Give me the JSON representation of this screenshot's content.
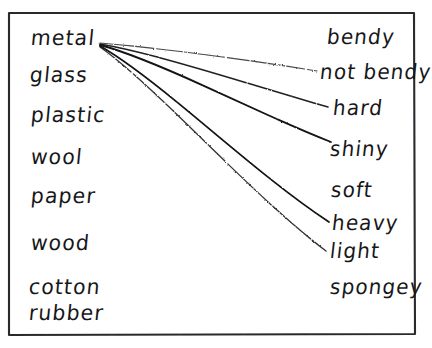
{
  "worksheet": {
    "title": "Materials and Properties Matching",
    "style": {
      "ink_color": "#17171a",
      "paper_color": "#ffffff",
      "border_color": "#2b2b2e"
    },
    "border": {
      "x": 8,
      "y": 12,
      "width": 407,
      "height": 323
    },
    "columns": {
      "left": {
        "name": "materials",
        "items": [
          {
            "id": "metal",
            "label": "metal",
            "x": 30,
            "y": 28
          },
          {
            "id": "glass",
            "label": "glass",
            "x": 29,
            "y": 65
          },
          {
            "id": "plastic",
            "label": "plastic",
            "x": 30,
            "y": 105
          },
          {
            "id": "wool",
            "label": "wool",
            "x": 30,
            "y": 147
          },
          {
            "id": "paper",
            "label": "paper",
            "x": 30,
            "y": 186
          },
          {
            "id": "wood",
            "label": "wood",
            "x": 30,
            "y": 233
          },
          {
            "id": "cotton",
            "label": "cotton",
            "x": 28,
            "y": 277
          },
          {
            "id": "rubber",
            "label": "rubber",
            "x": 28,
            "y": 303
          }
        ]
      },
      "right": {
        "name": "properties",
        "items": [
          {
            "id": "bendy",
            "label": "bendy",
            "x": 326,
            "y": 27
          },
          {
            "id": "not-bendy",
            "label": "not bendy",
            "x": 319,
            "y": 62
          },
          {
            "id": "hard",
            "label": "hard",
            "x": 332,
            "y": 98
          },
          {
            "id": "shiny",
            "label": "shiny",
            "x": 329,
            "y": 139
          },
          {
            "id": "soft",
            "label": "soft",
            "x": 330,
            "y": 180
          },
          {
            "id": "heavy",
            "label": "heavy",
            "x": 331,
            "y": 213
          },
          {
            "id": "light",
            "label": "light",
            "x": 329,
            "y": 241
          },
          {
            "id": "spongey",
            "label": "spongey",
            "x": 329,
            "y": 277
          }
        ]
      }
    },
    "connections": {
      "origin": {
        "from": "metal",
        "x": 100,
        "y": 44
      },
      "lines": [
        {
          "id": "metal-to-not-bendy",
          "from": "metal",
          "to": "not bendy",
          "x1": 100,
          "y1": 43,
          "x2": 317,
          "y2": 71,
          "weight": 1.1,
          "faded": true
        },
        {
          "id": "metal-to-hard",
          "from": "metal",
          "to": "hard",
          "x1": 100,
          "y1": 44,
          "x2": 328,
          "y2": 107,
          "weight": 1.5,
          "faded": false
        },
        {
          "id": "metal-to-shiny",
          "from": "metal",
          "to": "shiny",
          "x1": 100,
          "y1": 45,
          "x2": 331,
          "y2": 142,
          "weight": 1.8,
          "faded": false
        },
        {
          "id": "metal-to-heavy",
          "from": "metal",
          "to": "heavy",
          "x1": 100,
          "y1": 46,
          "x2": 329,
          "y2": 222,
          "weight": 1.7,
          "faded": false
        },
        {
          "id": "metal-to-light",
          "from": "metal",
          "to": "light",
          "x1": 100,
          "y1": 47,
          "x2": 326,
          "y2": 251,
          "weight": 1.3,
          "faded": true
        }
      ]
    }
  }
}
